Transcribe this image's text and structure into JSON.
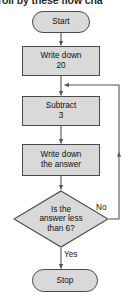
{
  "caption": {
    "text": "roll by these flow cha"
  },
  "colors": {
    "shape_fill": "#d9d9d9",
    "shape_stroke": "#4a4a4a",
    "connector": "#555555",
    "text": "#111111"
  },
  "flowchart": {
    "title": "",
    "nodes": [
      {
        "id": "start",
        "type": "terminator",
        "label": "Start"
      },
      {
        "id": "write20",
        "type": "process",
        "label": "Write down\n20"
      },
      {
        "id": "subtract3",
        "type": "process",
        "label": "Subtract\n3"
      },
      {
        "id": "writeans",
        "type": "process",
        "label": "Write down\nthe answer"
      },
      {
        "id": "decision",
        "type": "decision",
        "label": "Is the\nanswer less\nthan 6?"
      },
      {
        "id": "stop",
        "type": "terminator",
        "label": "Stop"
      }
    ],
    "edges": [
      {
        "from": "start",
        "to": "write20",
        "label": ""
      },
      {
        "from": "write20",
        "to": "subtract3",
        "label": ""
      },
      {
        "from": "subtract3",
        "to": "writeans",
        "label": ""
      },
      {
        "from": "writeans",
        "to": "decision",
        "label": ""
      },
      {
        "from": "decision",
        "to": "stop",
        "label": "Yes"
      },
      {
        "from": "decision",
        "to": "subtract3",
        "label": "No"
      }
    ],
    "branch_labels": {
      "no": "No",
      "yes": "Yes"
    }
  }
}
